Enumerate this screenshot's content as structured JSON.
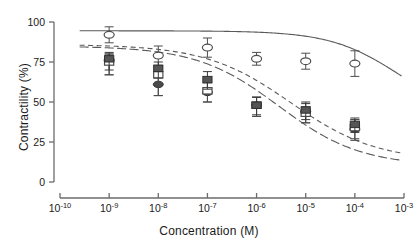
{
  "chart_data": {
    "type": "scatter",
    "title": "",
    "xlabel": "Concentration (M)",
    "ylabel": "Contractility (%)",
    "xscale": "log",
    "xlim": [
      -10,
      -3
    ],
    "ylim": [
      0,
      100
    ],
    "yticks": [
      0,
      25,
      50,
      75,
      100
    ],
    "ytick_labels": [
      "0",
      "25",
      "50",
      "75",
      "100"
    ],
    "xticks": [
      -10,
      -9,
      -8,
      -7,
      -6,
      -5,
      -4,
      -3
    ],
    "xtick_labels": [
      "10-10",
      "10-9",
      "10-8",
      "10-7",
      "10-6",
      "10-5",
      "10-4",
      "10-3"
    ],
    "xtick_bases": [
      "10",
      "10",
      "10",
      "10",
      "10",
      "10",
      "10",
      "10"
    ],
    "xtick_exponents": [
      "-10",
      "-9",
      "-8",
      "-7",
      "-6",
      "-5",
      "-4",
      "-3"
    ],
    "grid": false,
    "legend": "none",
    "x_categories": [
      -9,
      -8,
      -7,
      -6,
      -5,
      -4
    ],
    "series": [
      {
        "name": "open-circle",
        "marker": "open-circle",
        "color": "#4d4d4d",
        "x": [
          -9,
          -8,
          -7,
          -6,
          -5,
          -4
        ],
        "values": [
          92,
          79,
          84,
          77,
          75.5,
          74
        ],
        "err_up": [
          5,
          6,
          6,
          4,
          5,
          8
        ],
        "err_dn": [
          5,
          6,
          6,
          4,
          5,
          8
        ]
      },
      {
        "name": "filled-circle",
        "marker": "filled-circle",
        "color": "#3a3a3a",
        "x": [
          -9,
          -8,
          -7,
          -6,
          -5,
          -4
        ],
        "values": [
          76,
          61,
          56,
          48,
          44,
          33
        ],
        "err_up": [
          4,
          7,
          6,
          5,
          5,
          6
        ],
        "err_dn": [
          9,
          7,
          6,
          7,
          7,
          6
        ]
      },
      {
        "name": "open-square",
        "marker": "open-square",
        "color": "#4d4d4d",
        "x": [
          -9,
          -8,
          -7,
          -6,
          -5,
          -4
        ],
        "values": [
          75,
          67,
          57,
          48,
          43,
          34
        ],
        "err_up": [
          5,
          5,
          8,
          5,
          4,
          5
        ],
        "err_dn": [
          8,
          13,
          7,
          7,
          6,
          8
        ]
      },
      {
        "name": "filled-square",
        "marker": "filled-square",
        "color": "#3a3a3a",
        "x": [
          -9,
          -8,
          -7,
          -6,
          -5,
          -4
        ],
        "values": [
          77,
          71,
          64,
          48,
          45,
          36
        ],
        "err_up": [
          4,
          4,
          5,
          5,
          5,
          4
        ],
        "err_dn": [
          7,
          6,
          6,
          6,
          6,
          5
        ]
      }
    ],
    "curves": [
      {
        "name": "curve-solid-upper",
        "style": "solid",
        "color": "#5a5a5a",
        "top": 94.5,
        "bottom": 40,
        "logEC50": -3.1,
        "hill": 0.62,
        "x_start": -9.6,
        "x_end": -3.05
      },
      {
        "name": "curve-dashed",
        "style": "dashed",
        "color": "#5a5a5a",
        "top": 86,
        "bottom": 13,
        "logEC50": -5.3,
        "hill": 0.5,
        "x_start": -9.6,
        "x_end": -3.05
      },
      {
        "name": "curve-dashdot",
        "style": "dashdot",
        "color": "#5a5a5a",
        "top": 85,
        "bottom": 10,
        "logEC50": -5.55,
        "hill": 0.52,
        "x_start": -9.6,
        "x_end": -3.05
      }
    ]
  },
  "axis": {
    "y_title": "Contractility (%)",
    "x_title": "Concentration (M)"
  }
}
